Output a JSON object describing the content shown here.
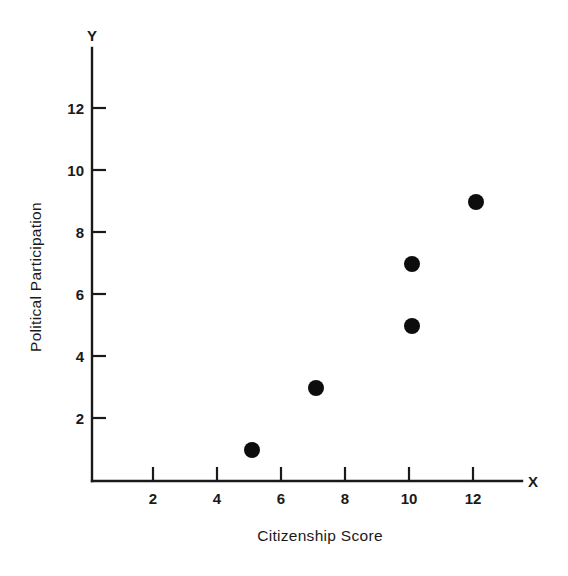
{
  "chart_data": {
    "type": "scatter",
    "title": "",
    "xlabel": "Citizenship Score",
    "ylabel": "Political Participation",
    "x_axis_end_label": "X",
    "y_axis_end_label": "Y",
    "xlim": [
      0,
      13.5
    ],
    "ylim": [
      0,
      13.5
    ],
    "xticks": [
      2,
      4,
      6,
      8,
      10,
      12
    ],
    "yticks": [
      2,
      4,
      6,
      8,
      10,
      12
    ],
    "xtick_labels": [
      "2",
      "4",
      "6",
      "8",
      "10",
      "12"
    ],
    "ytick_labels": [
      "2",
      "4",
      "6",
      "8",
      "10",
      "12"
    ],
    "grid": false,
    "legend": false,
    "marker": "filled-circle",
    "marker_color": "#0d0d0d",
    "marker_radius_px": 8,
    "points": [
      {
        "x": 5,
        "y": 1
      },
      {
        "x": 7,
        "y": 3
      },
      {
        "x": 10,
        "y": 5
      },
      {
        "x": 10,
        "y": 7
      },
      {
        "x": 12,
        "y": 9
      }
    ],
    "x": [
      5,
      7,
      10,
      10,
      12
    ],
    "values": [
      1,
      3,
      5,
      7,
      9
    ]
  },
  "colors": {
    "axis": "#1a1a1a",
    "marker": "#0d0d0d",
    "background": "#ffffff"
  }
}
